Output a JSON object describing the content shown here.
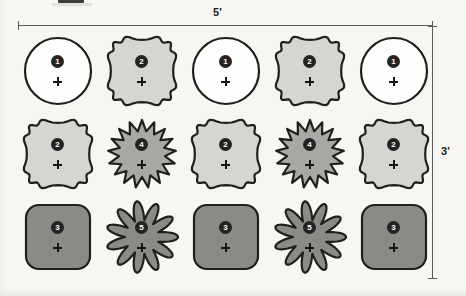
{
  "diagram": {
    "background_color": "#f7f6f3",
    "dimensions": {
      "width_label": "5'",
      "height_label": "3'"
    },
    "stroke_color": "#1f1f1f",
    "palette": {
      "white": "#fdfdfb",
      "light_gray": "#d6d5d1",
      "medium_gray": "#a9a8a4",
      "dark_gray": "#8a8a86",
      "badge_fill": "#232323",
      "badge_text": "#ffffff"
    },
    "legend_note": "",
    "rows": [
      {
        "row_label": "row-1",
        "cells": [
          {
            "shape": "circle",
            "number": "1",
            "fill": "#fdfdfb",
            "marker": "plus-marker"
          },
          {
            "shape": "scallop",
            "number": "2",
            "fill": "#d6d5d1",
            "marker": "plus-marker"
          },
          {
            "shape": "circle",
            "number": "1",
            "fill": "#fdfdfb",
            "marker": "plus-marker"
          },
          {
            "shape": "scallop",
            "number": "2",
            "fill": "#d6d5d1",
            "marker": "plus-marker"
          },
          {
            "shape": "circle",
            "number": "1",
            "fill": "#fdfdfb",
            "marker": "plus-marker"
          }
        ]
      },
      {
        "row_label": "row-2",
        "cells": [
          {
            "shape": "scallop",
            "number": "2",
            "fill": "#d6d5d1",
            "marker": "plus-marker"
          },
          {
            "shape": "starburst",
            "number": "4",
            "fill": "#a9a8a4",
            "marker": "plus-marker"
          },
          {
            "shape": "scallop",
            "number": "2",
            "fill": "#d6d5d1",
            "marker": "plus-marker"
          },
          {
            "shape": "starburst",
            "number": "4",
            "fill": "#a9a8a4",
            "marker": "plus-marker"
          },
          {
            "shape": "scallop",
            "number": "2",
            "fill": "#d6d5d1",
            "marker": "plus-marker"
          }
        ]
      },
      {
        "row_label": "row-3",
        "cells": [
          {
            "shape": "rounded-square",
            "number": "3",
            "fill": "#8a8a86",
            "marker": "plus-marker"
          },
          {
            "shape": "flower",
            "number": "5",
            "fill": "#8a8a86",
            "marker": "plus-marker"
          },
          {
            "shape": "rounded-square",
            "number": "3",
            "fill": "#8a8a86",
            "marker": "plus-marker"
          },
          {
            "shape": "flower",
            "number": "5",
            "fill": "#8a8a86",
            "marker": "plus-marker"
          },
          {
            "shape": "rounded-square",
            "number": "3",
            "fill": "#8a8a86",
            "marker": "plus-marker"
          }
        ]
      }
    ]
  }
}
